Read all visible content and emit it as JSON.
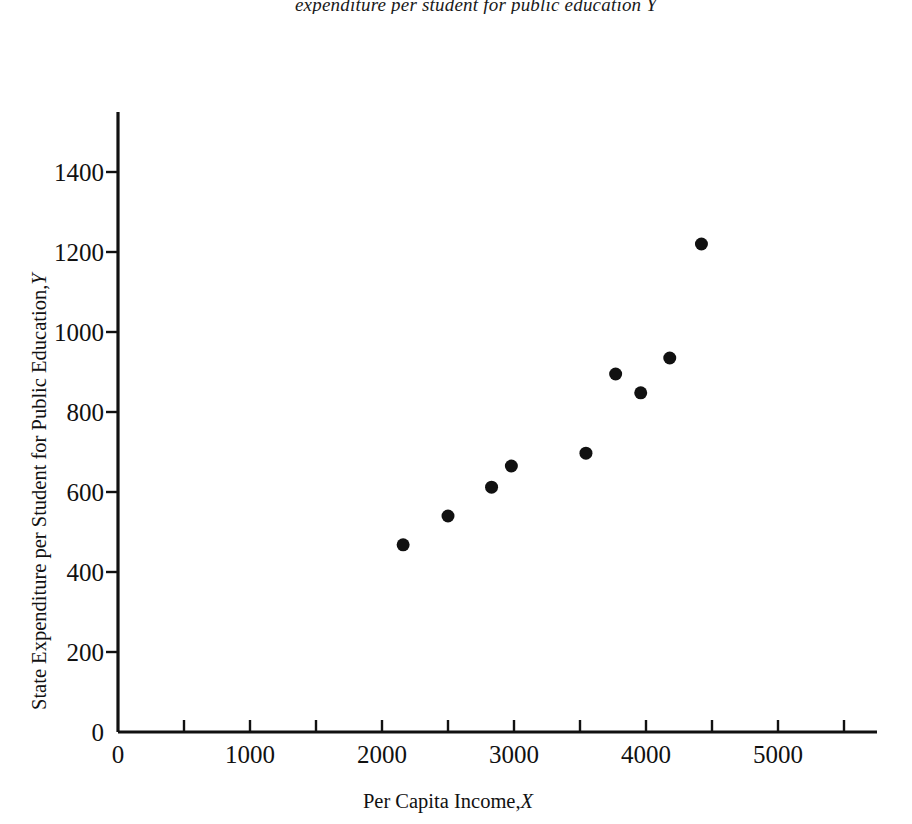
{
  "caption": {
    "text": "expenditure per student for public education Y"
  },
  "chart_data": {
    "type": "scatter",
    "title": "expenditure per student for public education Y",
    "xlabel": "Per Capita Income, X",
    "xlabel_plain": "Per Capita Income,",
    "xlabel_symbol": "X",
    "ylabel": "State Expenditure per Student for Public Education, Y",
    "ylabel_plain": "State Expenditure per Student for Public Education,",
    "ylabel_symbol": "Y",
    "xlim": [
      0,
      5750
    ],
    "ylim": [
      0,
      1550
    ],
    "grid": false,
    "legend": null,
    "x_major_ticks": [
      0,
      1000,
      2000,
      3000,
      4000,
      5000
    ],
    "x_minor_ticks": [
      500,
      1500,
      2500,
      3500,
      4500,
      5500
    ],
    "x_tick_labels": [
      "0",
      "1000",
      "2000",
      "3000",
      "4000",
      "5000"
    ],
    "y_major_ticks": [
      0,
      200,
      400,
      600,
      800,
      1000,
      1200,
      1400
    ],
    "y_tick_labels": [
      "0",
      "200",
      "400",
      "600",
      "800",
      "1000",
      "1200",
      "1400"
    ],
    "marker": "filled-circle",
    "marker_color": "#111111",
    "marker_size": 13,
    "points": [
      {
        "x": 2160,
        "y": 468
      },
      {
        "x": 2500,
        "y": 540
      },
      {
        "x": 2830,
        "y": 612
      },
      {
        "x": 2980,
        "y": 665
      },
      {
        "x": 3545,
        "y": 697
      },
      {
        "x": 3770,
        "y": 895
      },
      {
        "x": 3960,
        "y": 848
      },
      {
        "x": 4180,
        "y": 935
      },
      {
        "x": 4420,
        "y": 1220
      }
    ]
  }
}
